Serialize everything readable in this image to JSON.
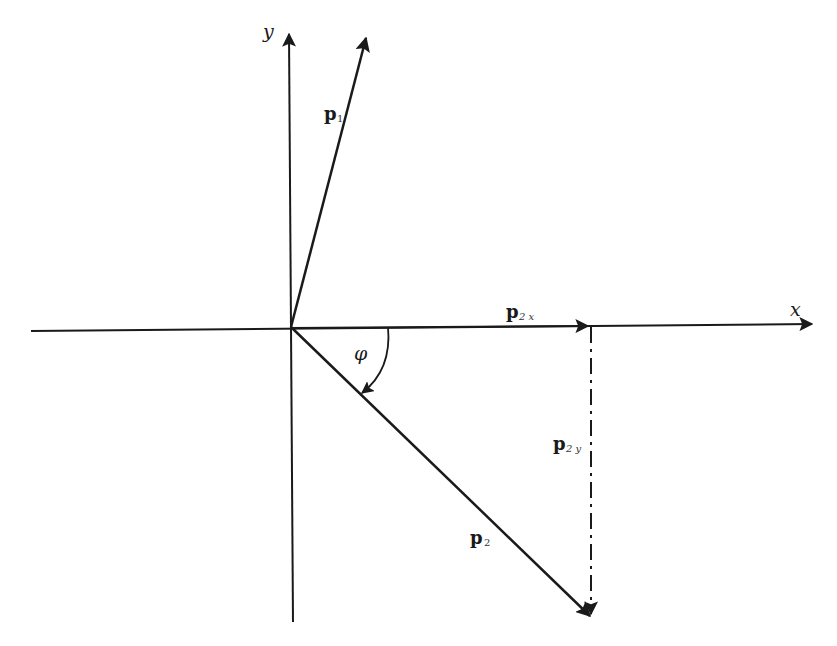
{
  "diagram": {
    "axes": {
      "x_label": "x",
      "y_label": "y"
    },
    "vectors": {
      "p1": {
        "base": "p",
        "subscript": "1"
      },
      "p2": {
        "base": "p",
        "subscript": "2"
      },
      "p2x": {
        "base": "p",
        "subscript": "2 x"
      },
      "p2y": {
        "base": "p",
        "subscript": "2 y"
      }
    },
    "angle": {
      "symbol": "φ"
    },
    "colors": {
      "stroke": "#1a1a1a",
      "background": "#ffffff"
    }
  }
}
